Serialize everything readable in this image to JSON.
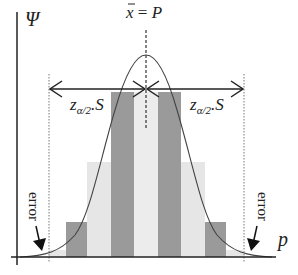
{
  "diagram": {
    "y_axis_label": "Ψ",
    "x_axis_label": "p",
    "mean_label": "x̄ = P",
    "mean_label_parts": {
      "xbar": "x",
      "eq": " = ",
      "P": "P"
    },
    "interval_left_label": {
      "z": "z",
      "sub": "α/2",
      "rest": ".S"
    },
    "interval_right_label": {
      "z": "z",
      "sub": "α/2",
      "rest": ".S"
    },
    "error_left_label": "error",
    "error_right_label": "error"
  },
  "colors": {
    "axis": "#222222",
    "curve": "#444444",
    "dark_bar": "#9a9a9a",
    "light_bar": "#e6e6e6",
    "dotted": "#777777"
  },
  "bars": {
    "dark": [
      {
        "x": 66,
        "width": 21,
        "top": 222
      },
      {
        "x": 111,
        "width": 23,
        "top": 92
      },
      {
        "x": 158,
        "width": 23,
        "top": 92
      },
      {
        "x": 205,
        "width": 21,
        "top": 222
      }
    ],
    "light": [
      {
        "x": 87,
        "width": 24,
        "top": 162
      },
      {
        "x": 134,
        "width": 24,
        "top": 92
      },
      {
        "x": 181,
        "width": 24,
        "top": 162
      },
      {
        "x": 49,
        "width": 17,
        "top": 250
      },
      {
        "x": 226,
        "width": 17,
        "top": 250
      }
    ],
    "baseline": 257
  }
}
